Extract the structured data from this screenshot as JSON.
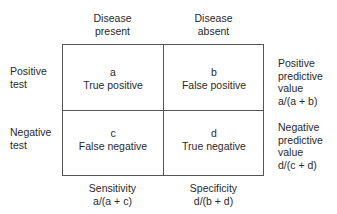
{
  "columns": [
    {
      "line1": "Disease",
      "line2": "present"
    },
    {
      "line1": "Disease",
      "line2": "absent"
    }
  ],
  "rows": [
    {
      "line1": "Positive",
      "line2": "test"
    },
    {
      "line1": "Negative",
      "line2": "test"
    }
  ],
  "cells": [
    {
      "letter": "a",
      "label": "True positive"
    },
    {
      "letter": "b",
      "label": "False positive"
    },
    {
      "letter": "c",
      "label": "False negative"
    },
    {
      "letter": "d",
      "label": "True negative"
    }
  ],
  "row_metrics": [
    {
      "line1": "Positive",
      "line2": "predictive",
      "line3": "value",
      "formula": "a/(a + b)"
    },
    {
      "line1": "Negative",
      "line2": "predictive",
      "line3": "value",
      "formula": "d/(c + d)"
    }
  ],
  "col_metrics": [
    {
      "label": "Sensitivity",
      "formula": "a/(a + c)"
    },
    {
      "label": "Specificity",
      "formula": "d/(b + d)"
    }
  ]
}
